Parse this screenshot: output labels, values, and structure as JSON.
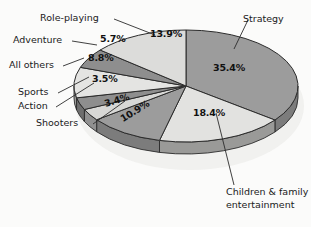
{
  "chart_data": {
    "type": "pie",
    "title": "",
    "subtitle": "",
    "xlabel": "",
    "ylabel": "",
    "legend_position": "callout-labels",
    "three_d": true,
    "start_angle_deg": 0,
    "direction": "clockwise",
    "units": "percent",
    "categories": [
      "Strategy",
      "Children & family entertainment",
      "Shooters",
      "Action",
      "Sports",
      "All others",
      "Adventure",
      "Role-playing"
    ],
    "values": [
      35.4,
      18.4,
      10.9,
      3.4,
      3.5,
      8.8,
      5.7,
      13.9
    ],
    "labels": [
      "35.4%",
      "18.4%",
      "10.9%",
      "3.4%",
      "3.5%",
      "8.8%",
      "5.7%",
      "13.9%"
    ],
    "slice_colors": [
      "#9c9c9c",
      "#e2e2e0",
      "#9c9c9c",
      "#d8d8d6",
      "#8e8e8e",
      "#e4e4e2",
      "#8e8e8e",
      "#dcdcda"
    ],
    "side_colors": [
      "#7c7c7c",
      "#9a9a98",
      "#7c7c7c",
      "#909090",
      "#6e6e6e",
      "#9c9c9a",
      "#6e6e6e",
      "#949492"
    ],
    "slices": [
      {
        "name": "Strategy",
        "value": 35.4,
        "label": "35.4%",
        "color": "#9c9c9c"
      },
      {
        "name": "Children & family entertainment",
        "value": 18.4,
        "label": "18.4%",
        "color": "#e2e2e0"
      },
      {
        "name": "Shooters",
        "value": 10.9,
        "label": "10.9%",
        "color": "#9c9c9c"
      },
      {
        "name": "Action",
        "value": 3.4,
        "label": "3.4%",
        "color": "#d8d8d6"
      },
      {
        "name": "Sports",
        "value": 3.5,
        "label": "3.5%",
        "color": "#8e8e8e"
      },
      {
        "name": "All others",
        "value": 8.8,
        "label": "8.8%",
        "color": "#e4e4e2"
      },
      {
        "name": "Adventure",
        "value": 5.7,
        "label": "5.7%",
        "color": "#8e8e8e"
      },
      {
        "name": "Role-playing",
        "value": 13.9,
        "label": "13.9%",
        "color": "#dcdcda"
      }
    ]
  },
  "labels": {
    "strategy": "Strategy",
    "children_line1": "Children & family",
    "children_line2": "entertainment",
    "shooters": "Shooters",
    "action": "Action",
    "sports": "Sports",
    "all_others": "All others",
    "adventure": "Adventure",
    "role_playing": "Role-playing"
  },
  "percents": {
    "strategy": "35.4%",
    "children": "18.4%",
    "shooters": "10.9%",
    "action": "3.4%",
    "sports": "3.5%",
    "all_others": "8.8%",
    "adventure": "5.7%",
    "role_playing": "13.9%"
  },
  "colors": {
    "background": "#fbfbfa",
    "outline": "#2b2b2b",
    "text": "#1a1a1a",
    "shadow": "#ececea"
  }
}
